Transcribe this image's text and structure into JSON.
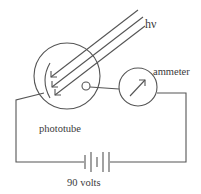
{
  "diagram": {
    "type": "photoelectric-circuit",
    "labels": {
      "light": "hν",
      "ammeter": "ammeter",
      "phototube": "phototube",
      "battery": "90 volts"
    },
    "components": [
      {
        "id": "phototube",
        "label": "phototube",
        "shape": "circle",
        "contains": [
          "cathode-arc",
          "anode-ring"
        ]
      },
      {
        "id": "ammeter",
        "label": "ammeter",
        "shape": "circle-with-arrow"
      },
      {
        "id": "battery",
        "label": "90 volts",
        "shape": "multi-cell-battery"
      },
      {
        "id": "light-rays",
        "label": "hν",
        "count": 3
      }
    ],
    "connections": [
      [
        "cathode",
        "battery-left"
      ],
      [
        "anode",
        "ammeter"
      ],
      [
        "ammeter",
        "battery-right"
      ]
    ],
    "colors": {
      "line": "#555555",
      "text": "#3a3a3a",
      "background": "#ffffff"
    }
  }
}
